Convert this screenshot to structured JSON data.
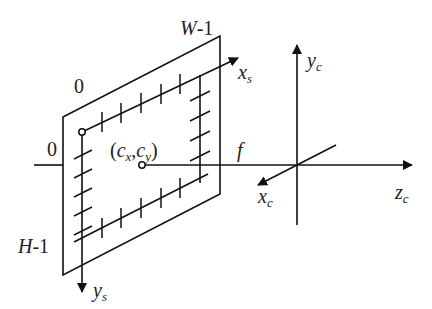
{
  "diagram": {
    "colors": {
      "stroke": "#111111",
      "text": "#222222",
      "background": "#ffffff"
    },
    "labels": {
      "w_minus_1": {
        "var": "W",
        "rest": "-1"
      },
      "h_minus_1": {
        "var": "H",
        "rest": "-1"
      },
      "origin_top": "0",
      "origin_left": "0",
      "principal_point": {
        "open": "(",
        "c1": "c",
        "s1": "x",
        "comma": ",",
        "c2": "c",
        "s2": "y",
        "close": ")"
      },
      "focal_length": "f",
      "xs": {
        "base": "x",
        "sub": "s"
      },
      "ys": {
        "base": "y",
        "sub": "s"
      },
      "xc": {
        "base": "x",
        "sub": "c"
      },
      "yc": {
        "base": "y",
        "sub": "c"
      },
      "zc": {
        "base": "z",
        "sub": "c"
      }
    },
    "nodes": [
      {
        "id": "image-plane",
        "type": "parallelogram",
        "label": "image plane"
      },
      {
        "id": "image-origin",
        "type": "small-circle",
        "label": "0,0"
      },
      {
        "id": "principal-point",
        "type": "small-circle",
        "label": "(cx,cy)"
      },
      {
        "id": "camera-center",
        "type": "axis-origin",
        "label": "camera frame"
      }
    ],
    "edges": [
      {
        "from": "image-origin",
        "to": "xs",
        "label": "xs",
        "style": "arrow"
      },
      {
        "from": "image-origin",
        "to": "ys",
        "label": "ys",
        "style": "arrow"
      },
      {
        "from": "principal-point",
        "to": "camera-center",
        "label": "f",
        "style": "line"
      },
      {
        "from": "camera-center",
        "to": "zc",
        "label": "zc",
        "style": "arrow"
      },
      {
        "from": "camera-center",
        "to": "yc",
        "label": "yc",
        "style": "arrow"
      },
      {
        "from": "camera-center",
        "to": "xc",
        "label": "xc",
        "style": "arrow"
      }
    ]
  }
}
